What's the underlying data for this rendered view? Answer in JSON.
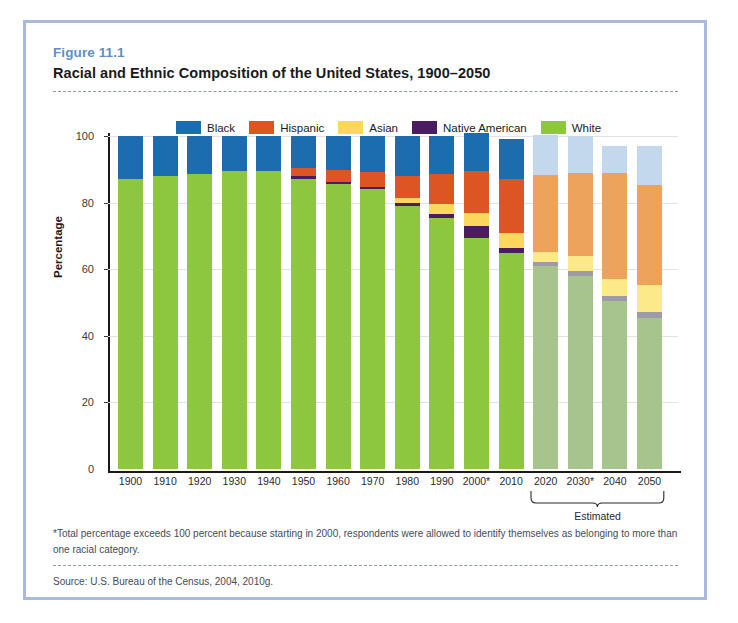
{
  "figure": {
    "number": "Figure 11.1",
    "title": "Racial and Ethnic Composition of the United States, 1900–2050",
    "footnote": "*Total percentage exceeds 100 percent because starting in 2000, respondents were allowed to identify themselves as belonging to more than one racial category.",
    "source": "Source: U.S. Bureau of the Census, 2004, 2010g.",
    "estimated_bracket_label": "Estimated"
  },
  "colors": {
    "black": "#1c6cb0",
    "hispanic": "#dd5522",
    "asian": "#fbd85c",
    "native_american": "#4a1d63",
    "white": "#8dc63f",
    "black_est": "#c3d8ec",
    "hispanic_est": "#eda35c",
    "asian_est": "#fbe98a",
    "native_american_est": "#9e9aa8",
    "white_est": "#a8c48d",
    "frame": "#a9bade",
    "fig_number": "#5f8fc4",
    "axis": "#1a1a1a",
    "grid": "#e2e2e2"
  },
  "chart_data": {
    "type": "bar",
    "subtype": "stacked-bar",
    "title": "Racial and Ethnic Composition of the United States, 1900–2050",
    "xlabel": "",
    "ylabel": "Percentage",
    "ylim": [
      0,
      100
    ],
    "yticks": [
      0,
      20,
      40,
      60,
      80,
      100
    ],
    "ytick_labels": [
      "0",
      "20",
      "40",
      "60",
      "80",
      "100"
    ],
    "grid": true,
    "legend_position": "top-center",
    "legend": [
      "Black",
      "Hispanic",
      "Asian",
      "Native American",
      "White"
    ],
    "categories": [
      "1900",
      "1910",
      "1920",
      "1930",
      "1940",
      "1950",
      "1960",
      "1970",
      "1980",
      "1990",
      "2000*",
      "2010",
      "2020",
      "2030*",
      "2040",
      "2050"
    ],
    "estimated_categories": [
      "2020",
      "2030*",
      "2040",
      "2050"
    ],
    "stack_order_bottom_to_top": [
      "White",
      "Native American",
      "Asian",
      "Hispanic",
      "Black"
    ],
    "series": [
      {
        "name": "White",
        "color": "#8dc63f",
        "values": [
          87,
          88,
          88.5,
          89.5,
          89.5,
          87,
          85.5,
          84,
          79,
          75.5,
          69.5,
          65,
          61,
          58,
          50.5,
          45.5
        ]
      },
      {
        "name": "Native American",
        "color": "#4a1d63",
        "values": [
          0,
          0,
          0,
          0,
          0,
          1,
          0.8,
          0.8,
          1,
          1.2,
          3.5,
          1.5,
          1.2,
          1.5,
          1.5,
          1.8
        ]
      },
      {
        "name": "Asian",
        "color": "#fbd85c",
        "values": [
          0,
          0,
          0,
          0,
          0,
          0,
          0,
          0,
          1.5,
          3,
          4,
          4.5,
          3,
          4.5,
          5,
          8
        ]
      },
      {
        "name": "Hispanic",
        "color": "#dd5522",
        "values": [
          0,
          0,
          0,
          0,
          0,
          2.5,
          3.5,
          4.5,
          6.5,
          9,
          12.5,
          16,
          23,
          25,
          32,
          30
        ]
      },
      {
        "name": "Black",
        "color": "#1c6cb0",
        "values": [
          13,
          12,
          11.5,
          10.5,
          10.5,
          9.5,
          10.2,
          10.7,
          12,
          11.3,
          11.5,
          12,
          12,
          11,
          8,
          11.7
        ]
      }
    ],
    "totals": [
      100,
      100,
      100,
      100,
      100,
      100,
      100,
      100,
      100,
      100,
      101,
      99,
      100.2,
      100,
      97,
      97
    ]
  },
  "legend": {
    "items": [
      {
        "label": "Black",
        "color": "#1c6cb0"
      },
      {
        "label": "Hispanic",
        "color": "#dd5522"
      },
      {
        "label": "Asian",
        "color": "#fbd85c"
      },
      {
        "label": "Native American",
        "color": "#4a1d63"
      },
      {
        "label": "White",
        "color": "#8dc63f"
      }
    ]
  }
}
